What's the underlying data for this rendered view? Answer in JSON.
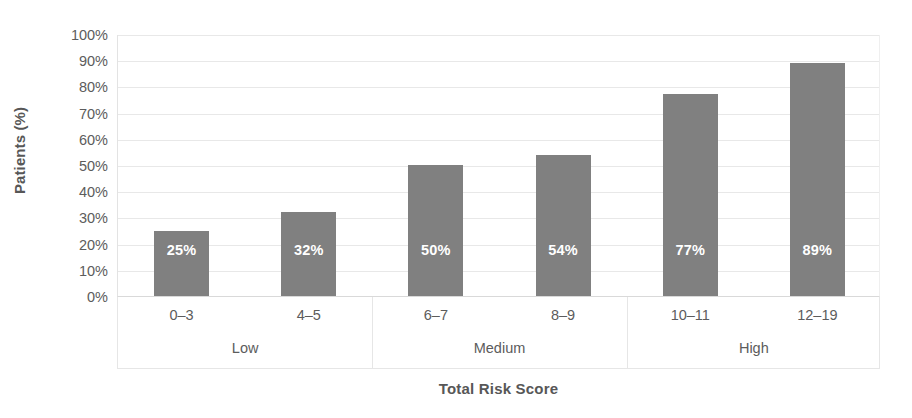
{
  "chart_data": {
    "type": "bar",
    "title": "",
    "xlabel": "Total Risk Score",
    "ylabel": "Patients (%)",
    "categories": [
      "0–3",
      "4–5",
      "6–7",
      "8–9",
      "10–11",
      "12–19"
    ],
    "values": [
      25,
      32,
      50,
      54,
      77,
      89
    ],
    "value_labels": [
      "25%",
      "32%",
      "50%",
      "54%",
      "77%",
      "89%"
    ],
    "groups": [
      {
        "label": "Low",
        "categories": [
          "0–3",
          "4–5"
        ]
      },
      {
        "label": "Medium",
        "categories": [
          "6–7",
          "8–9"
        ]
      },
      {
        "label": "High",
        "categories": [
          "10–11",
          "12–19"
        ]
      }
    ],
    "ylim": [
      0,
      100
    ],
    "ytick_labels": [
      "0%",
      "10%",
      "20%",
      "30%",
      "40%",
      "50%",
      "60%",
      "70%",
      "80%",
      "90%",
      "100%"
    ],
    "ytick_values": [
      0,
      10,
      20,
      30,
      40,
      50,
      60,
      70,
      80,
      90,
      100
    ],
    "grid": true,
    "legend": false,
    "bar_color": "#808080",
    "label_color": "#ffffff",
    "grid_color": "#e8e8e8",
    "text_color": "#5c5c5c"
  }
}
